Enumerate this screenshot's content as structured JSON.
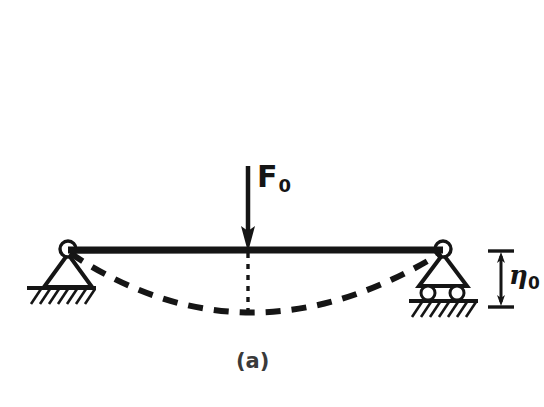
{
  "figure": {
    "caption": "(a)",
    "background_color": "#ffffff",
    "ink_color": "#151515",
    "caption_color": "#3a3a3a"
  },
  "labels": {
    "force": {
      "symbol": "F",
      "subscript": "0"
    },
    "deflection": {
      "symbol": "η",
      "subscript": "0"
    }
  },
  "diagram": {
    "type": "simply-supported-beam-deflection",
    "beam": {
      "left_x": 68,
      "right_x": 443,
      "y": 250,
      "thickness": 7
    },
    "supports": {
      "left": {
        "kind": "pin",
        "x": 68,
        "circle_y": 250,
        "circle_r": 8,
        "base_y": 287,
        "ground_x1": 27,
        "ground_x2": 96
      },
      "right": {
        "kind": "roller",
        "x": 443,
        "circle_y": 250,
        "circle_r": 8,
        "base_y": 286,
        "roller_y": 293,
        "roller_r": 7,
        "ground_y": 301,
        "ground_x1": 409,
        "ground_x2": 478
      }
    },
    "load": {
      "kind": "point-force-arrow",
      "x": 248,
      "tail_y": 166,
      "tip_y": 250,
      "direction": "down"
    },
    "deflected_shape": {
      "kind": "dashed-curve",
      "start": [
        68,
        252
      ],
      "end": [
        443,
        252
      ],
      "lowest_point": [
        248,
        312
      ]
    },
    "center_line": {
      "kind": "dotted",
      "x": 248,
      "top_y": 254,
      "bottom_y": 312
    },
    "dimension": {
      "kind": "vertical-double-arrow",
      "x": 501,
      "top_y": 251,
      "bottom_y": 307,
      "tick_half_width": 13
    }
  }
}
